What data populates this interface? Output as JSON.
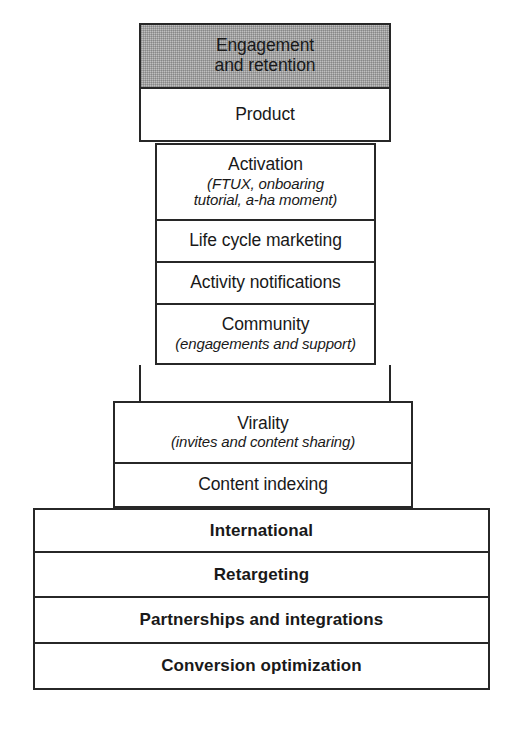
{
  "diagram": {
    "accent_shade_color": "#bfbfbf",
    "line_color": "#272727",
    "background_color": "#ffffff",
    "levels": [
      {
        "id": "engagement",
        "label_line1": "Engagement",
        "label_line2": "and retention",
        "shaded": true,
        "bold": false
      },
      {
        "id": "product",
        "label": "Product",
        "shaded": false,
        "bold": false
      },
      {
        "id": "activation",
        "label": "Activation",
        "sub_line1": "(FTUX, onboaring",
        "sub_line2": "tutorial, a-ha moment)",
        "shaded": false,
        "bold": false
      },
      {
        "id": "life-cycle-marketing",
        "label": "Life cycle marketing",
        "shaded": false,
        "bold": false
      },
      {
        "id": "activity-notifications",
        "label": "Activity notifications",
        "shaded": false,
        "bold": false
      },
      {
        "id": "community",
        "label": "Community",
        "sub_line1": "(engagements and support)",
        "shaded": false,
        "bold": false
      },
      {
        "id": "virality",
        "label": "Virality",
        "sub_line1": "(invites and content sharing)",
        "shaded": false,
        "bold": false
      },
      {
        "id": "content-indexing",
        "label": "Content indexing",
        "shaded": false,
        "bold": false
      },
      {
        "id": "international",
        "label": "International",
        "shaded": false,
        "bold": true
      },
      {
        "id": "retargeting",
        "label": "Retargeting",
        "shaded": false,
        "bold": true
      },
      {
        "id": "partnerships",
        "label": "Partnerships and integrations",
        "shaded": false,
        "bold": true
      },
      {
        "id": "conversion",
        "label": "Conversion optimization",
        "shaded": false,
        "bold": true
      }
    ],
    "caption": ""
  }
}
